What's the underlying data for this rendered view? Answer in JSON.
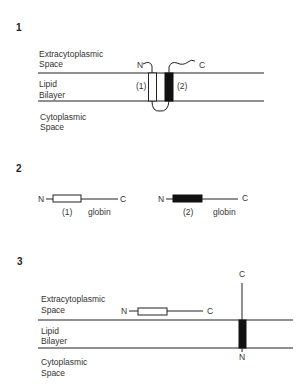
{
  "panels": [
    {
      "number": "1",
      "regions": {
        "extra_line1": "Extracytoplasmic",
        "extra_line2": "Space",
        "lipid_line1": "Lipid",
        "lipid_line2": "Bilayer",
        "cyto_line1": "Cytoplasmic",
        "cyto_line2": "Space"
      },
      "termini": {
        "n": "N",
        "c": "C"
      },
      "segments": {
        "seg1": "(1)",
        "seg2": "(2)"
      }
    },
    {
      "number": "2",
      "constructs": [
        {
          "n": "N",
          "c": "C",
          "segment": "(1)",
          "fusion": "globin",
          "fill": "white"
        },
        {
          "n": "N",
          "c": "C",
          "segment": "(2)",
          "fusion": "globin",
          "fill": "black"
        }
      ]
    },
    {
      "number": "3",
      "regions": {
        "extra_line1": "Extracytoplasmic",
        "extra_line2": "Space",
        "lipid_line1": "Lipid",
        "lipid_line2": "Bilayer",
        "cyto_line1": "Cytoplasmic",
        "cyto_line2": "Space"
      },
      "soluble": {
        "n": "N",
        "c": "C"
      },
      "membrane": {
        "n": "N",
        "c": "C"
      }
    }
  ],
  "colors": {
    "ink": "#222222",
    "background": "#ffffff"
  }
}
